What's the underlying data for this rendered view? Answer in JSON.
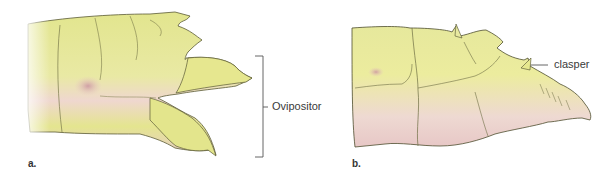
{
  "figure": {
    "panels": [
      {
        "letter": "a.",
        "subject": "female-abdomen-tip",
        "callout": {
          "label": "Ovipositor",
          "style": "bracket"
        }
      },
      {
        "letter": "b.",
        "subject": "male-abdomen-tip",
        "callout": {
          "label": "clasper",
          "style": "leader-line"
        }
      }
    ],
    "colors": {
      "body_fill": "#e6e89a",
      "body_highlight": "#f1f1bd",
      "pink_shade": "#e8c6c6",
      "outline": "#5a5a35",
      "label_text": "#3a3a3a",
      "callout_line": "#555555"
    }
  }
}
